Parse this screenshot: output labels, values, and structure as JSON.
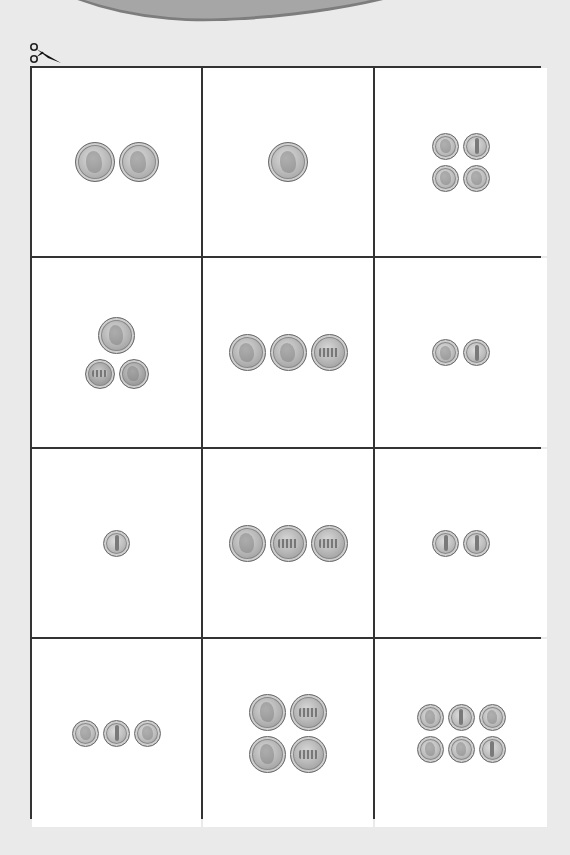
{
  "page": {
    "background": "#eaeaea",
    "grid_line_color": "#333333",
    "cell_background": "#ffffff"
  },
  "cut_marker": {
    "icon": "scissors-icon"
  },
  "cards": [
    {
      "row": 1,
      "col": 1,
      "coin_rows": [
        [
          "quarter-heads",
          "quarter-heads"
        ]
      ]
    },
    {
      "row": 1,
      "col": 2,
      "coin_rows": [
        [
          "quarter-heads"
        ]
      ]
    },
    {
      "row": 1,
      "col": 3,
      "coin_rows": [
        [
          "dime-heads",
          "dime-tails"
        ],
        [
          "dime-heads",
          "dime-heads"
        ]
      ]
    },
    {
      "row": 2,
      "col": 1,
      "coin_rows": [
        [
          "nickel-heads"
        ],
        [
          "penny-tails",
          "penny-heads"
        ]
      ]
    },
    {
      "row": 2,
      "col": 2,
      "coin_rows": [
        [
          "nickel-heads",
          "nickel-heads",
          "nickel-tails"
        ]
      ]
    },
    {
      "row": 2,
      "col": 3,
      "coin_rows": [
        [
          "dime-heads",
          "dime-tails"
        ]
      ]
    },
    {
      "row": 3,
      "col": 1,
      "coin_rows": [
        [
          "dime-tails"
        ]
      ]
    },
    {
      "row": 3,
      "col": 2,
      "coin_rows": [
        [
          "nickel-heads",
          "nickel-tails",
          "nickel-tails"
        ]
      ]
    },
    {
      "row": 3,
      "col": 3,
      "coin_rows": [
        [
          "dime-tails",
          "dime-tails"
        ]
      ]
    },
    {
      "row": 4,
      "col": 1,
      "coin_rows": [
        [
          "dime-heads",
          "dime-tails",
          "dime-heads"
        ]
      ]
    },
    {
      "row": 4,
      "col": 2,
      "coin_rows": [
        [
          "nickel-heads",
          "nickel-tails"
        ],
        [
          "nickel-heads",
          "nickel-tails"
        ]
      ]
    },
    {
      "row": 4,
      "col": 3,
      "coin_rows": [
        [
          "dime-heads",
          "dime-tails",
          "dime-heads"
        ],
        [
          "dime-heads",
          "dime-heads",
          "dime-tails"
        ]
      ]
    }
  ]
}
